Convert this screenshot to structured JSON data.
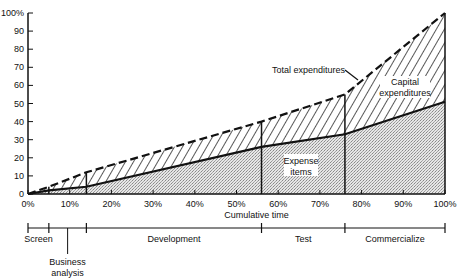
{
  "chart_data": {
    "type": "area",
    "title": "",
    "xlabel": "Cumulative time",
    "ylabel": "",
    "xlim": [
      0,
      100
    ],
    "ylim": [
      0,
      100
    ],
    "grid": false,
    "x_ticks": [
      "0%",
      "10%",
      "20%",
      "30%",
      "40%",
      "50%",
      "60%",
      "70%",
      "80%",
      "90%",
      "100%"
    ],
    "y_ticks": [
      "0",
      "10",
      "20",
      "30",
      "40",
      "50",
      "60",
      "70",
      "80",
      "90",
      "100%"
    ],
    "x": [
      0,
      5,
      14,
      56,
      76,
      100
    ],
    "series": [
      {
        "name": "Expense items",
        "values": [
          0,
          2,
          4,
          26,
          33,
          51
        ]
      },
      {
        "name": "Total expenditures",
        "values": [
          0,
          4,
          12,
          40,
          55,
          100
        ]
      }
    ],
    "phase_boundaries": [
      0,
      5,
      14,
      56,
      76,
      100
    ],
    "annotations": {
      "total": "Total expenditures",
      "capital_1": "Capital",
      "capital_2": "expenditures",
      "expense_1": "Expense",
      "expense_2": "items"
    },
    "phases": [
      {
        "label": "Screen",
        "start": 0,
        "end": 5
      },
      {
        "label": "Business",
        "label2": "analysis",
        "start": 5,
        "end": 14
      },
      {
        "label": "Development",
        "start": 14,
        "end": 56
      },
      {
        "label": "Test",
        "start": 56,
        "end": 76
      },
      {
        "label": "Commercialize",
        "start": 76,
        "end": 100
      }
    ]
  }
}
